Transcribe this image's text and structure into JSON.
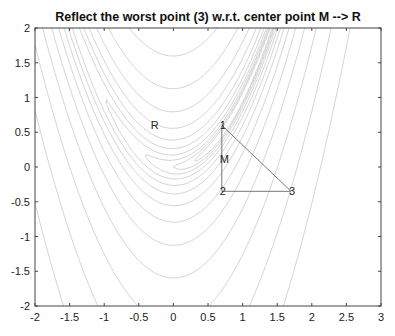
{
  "chart_data": {
    "type": "contour",
    "title": "Reflect the worst point (3) w.r.t. center point M --> R",
    "xlabel": "",
    "ylabel": "",
    "xlim": [
      -2,
      3
    ],
    "ylim": [
      -2,
      2
    ],
    "xticks": [
      "-2",
      "-1.5",
      "-1",
      "-0.5",
      "0",
      "0.5",
      "1",
      "1.5",
      "2",
      "2.5",
      "3"
    ],
    "yticks": [
      "2",
      "1.5",
      "1",
      "0.5",
      "0",
      "-0.5",
      "-1",
      "-1.5",
      "-2"
    ],
    "function": "Rosenbrock f(x,y) = (1-x)^2 + 100(y-x^2)^2",
    "contour_levels": [
      0.5,
      1,
      2,
      4,
      8,
      16,
      32,
      64,
      128,
      256,
      512,
      1024,
      2048
    ],
    "contour_color": "#c8c8c8",
    "simplex": {
      "points": [
        {
          "label": "1",
          "x": 0.7,
          "y": 0.6
        },
        {
          "label": "2",
          "x": 0.7,
          "y": -0.35
        },
        {
          "label": "3",
          "x": 1.7,
          "y": -0.35
        }
      ],
      "color": "#777777"
    },
    "annotations": [
      {
        "label": "M",
        "x": 0.7,
        "y": 0.12
      },
      {
        "label": "R",
        "x": -0.3,
        "y": 0.6
      }
    ],
    "grid": false
  }
}
